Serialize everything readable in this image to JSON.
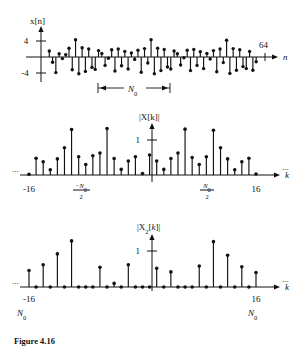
{
  "figure": {
    "caption": "Figure 4.16",
    "panels": [
      {
        "id": "panel-xn",
        "ylabel": "x[n]",
        "xlabel": "n",
        "ytick_pos_label": "4",
        "ytick_neg_label": "-4",
        "end_label": "64",
        "period_label": "N0",
        "period_bracket": true
      },
      {
        "id": "panel-Xk",
        "ylabel": "|X[k]|",
        "xlabel": "k",
        "ytick_label": "1",
        "xtick_left_label": "-16",
        "xtick_right_label": "16",
        "xtick_mid_left_num": "-N0",
        "xtick_mid_left_den": "2",
        "xtick_mid_right_num": "N0",
        "xtick_mid_right_den": "2",
        "ellipsis_left": "...",
        "ellipsis_right": "..."
      },
      {
        "id": "panel-X2k",
        "ylabel": "|X2[k]|",
        "ylabel_main": "|X",
        "ylabel_sub": "2",
        "ylabel_tail": "[k]|",
        "xlabel": "k",
        "ytick_label": "1",
        "xtick_left_label": "-16",
        "xtick_right_label": "16",
        "xtick_left_sub": "N0",
        "xtick_right_sub": "N0",
        "ellipsis_left": "...",
        "ellipsis_right": "..."
      }
    ]
  },
  "chart_data": [
    {
      "type": "stem",
      "title": "x[n]",
      "xlabel": "n",
      "ylabel": "x[n]",
      "ylim": [
        -5.2,
        5.2
      ],
      "yticks": [
        -4,
        4
      ],
      "ytick_labels": [
        "-4",
        "4"
      ],
      "xlim": [
        0,
        67
      ],
      "annotations": [
        {
          "text": "64",
          "x": 64,
          "note": "end of record marker on n-axis"
        },
        {
          "text": "N0",
          "x_from": 22,
          "x_to": 38,
          "note": "period bracket under axis"
        }
      ],
      "grid": false,
      "legend": false,
      "x": [
        1,
        2,
        3,
        4,
        5,
        6,
        7,
        8,
        9,
        10,
        11,
        12,
        13,
        14,
        15,
        16,
        17,
        18,
        19,
        20,
        21,
        22,
        23,
        24,
        25,
        26,
        27,
        28,
        29,
        30,
        31,
        32,
        33,
        34,
        35,
        36,
        37,
        38,
        39,
        40,
        41,
        42,
        43,
        44,
        45,
        46,
        47,
        48,
        49,
        50,
        51,
        52,
        53,
        54,
        55,
        56,
        57,
        58,
        59,
        60,
        61,
        62,
        63,
        64
      ],
      "values": [
        1.5,
        -1.3,
        -3.9,
        0.8,
        -0.4,
        0.6,
        2.2,
        -3.2,
        4.3,
        -4.2,
        2.3,
        -3.6,
        2.0,
        -2.6,
        -3.1,
        1.6,
        0.9,
        -2.1,
        -0.3,
        1.8,
        -3.5,
        2.0,
        -2.2,
        1.4,
        -3.0,
        1.0,
        -0.6,
        1.7,
        -3.8,
        2.1,
        -1.5,
        4.3,
        -4.2,
        2.2,
        -3.4,
        1.9,
        -2.5,
        -3.0,
        1.5,
        0.8,
        -2.0,
        -0.2,
        1.7,
        -3.4,
        1.9,
        -2.1,
        1.3,
        -2.9,
        0.9,
        -0.5,
        1.6,
        -3.7,
        2.0,
        -1.4,
        4.2,
        -4.1,
        2.1,
        -3.3,
        1.8,
        -2.4,
        -2.9,
        1.4,
        -3.3,
        -1.2
      ]
    },
    {
      "type": "stem",
      "title": "|X[k]|",
      "xlabel": "k",
      "ylabel": "|X[k]|",
      "ylim": [
        0,
        1.55
      ],
      "yticks": [
        1
      ],
      "ytick_labels": [
        "1"
      ],
      "xlim": [
        -16,
        16
      ],
      "xticks": [
        -16,
        -8,
        0,
        8,
        16
      ],
      "xtick_labels": [
        "-16",
        "-N0/2",
        "",
        "N0/2",
        "16"
      ],
      "grid": false,
      "legend": false,
      "x": [
        -16,
        -15,
        -14,
        -13,
        -12,
        -11,
        -10,
        -9,
        -8,
        -7,
        -6,
        -5,
        -4,
        -3,
        -2,
        -1,
        0,
        1,
        2,
        3,
        4,
        5,
        6,
        7,
        8,
        9,
        10,
        11,
        12,
        13,
        14,
        15,
        16
      ],
      "values": [
        0.02,
        0.48,
        0.38,
        0.15,
        0.46,
        0.78,
        1.3,
        0.52,
        0.3,
        0.55,
        0.63,
        1.33,
        0.47,
        0.16,
        0.4,
        0.52,
        0.04,
        0.57,
        0.4,
        0.16,
        0.47,
        0.63,
        1.31,
        0.5,
        0.3,
        0.52,
        1.28,
        0.78,
        0.46,
        0.15,
        0.38,
        0.48,
        0.03
      ]
    },
    {
      "type": "stem",
      "title": "|X2[k]|",
      "xlabel": "k",
      "ylabel": "|X2[k]|",
      "ylim": [
        0,
        1.55
      ],
      "yticks": [
        1
      ],
      "ytick_labels": [
        "1"
      ],
      "xlim": [
        -16,
        16
      ],
      "xticks": [
        -16,
        16
      ],
      "xtick_labels": [
        "-16",
        "16"
      ],
      "xtick_sublabels": [
        "N0",
        "N0"
      ],
      "grid": false,
      "legend": false,
      "note": "odd-indexed samples are zero; even-indexed samples carry magnitude",
      "x": [
        -16,
        -15,
        -14,
        -13,
        -12,
        -11,
        -10,
        -9,
        -8,
        -7,
        -6,
        -5,
        -4,
        -3,
        -2,
        -1,
        0,
        1,
        2,
        3,
        4,
        5,
        6,
        7,
        8,
        9,
        10,
        11,
        12,
        13,
        14,
        15,
        16
      ],
      "values": [
        0.46,
        0.0,
        0.62,
        0.0,
        0.92,
        0.0,
        1.28,
        0.0,
        0.0,
        0.0,
        0.55,
        0.0,
        0.1,
        0.0,
        0.62,
        0.0,
        0.0,
        0.0,
        0.52,
        0.0,
        0.42,
        0.0,
        0.0,
        0.0,
        0.58,
        0.0,
        1.26,
        0.0,
        0.88,
        0.0,
        0.56,
        0.0,
        0.4
      ]
    }
  ]
}
